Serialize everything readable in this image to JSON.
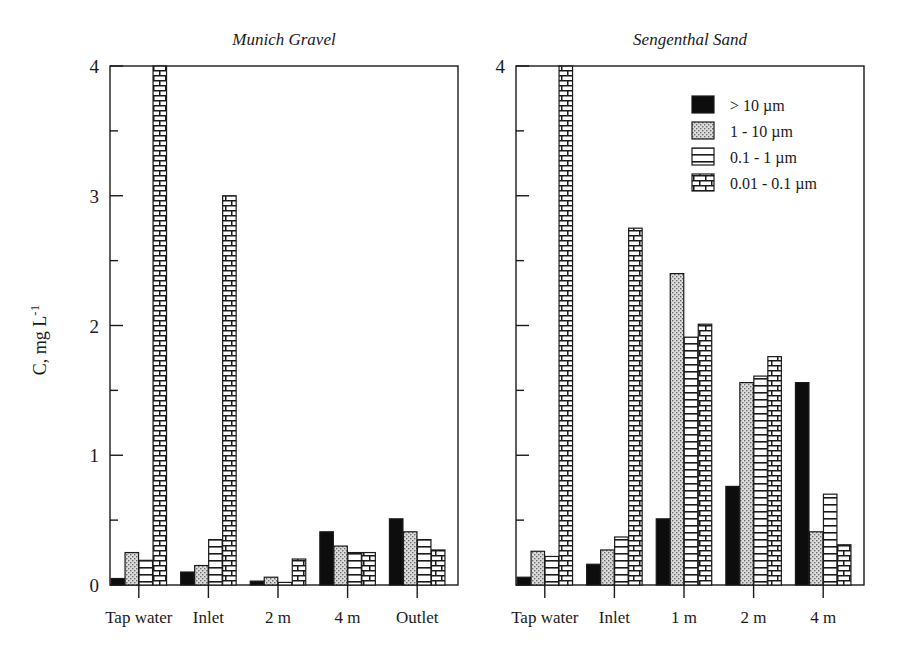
{
  "figure": {
    "axis_y_label": "C, mg L",
    "axis_y_label_sup": "-1",
    "y_ticks": [
      "0",
      "1",
      "2",
      "3",
      "4"
    ],
    "y_min": 0,
    "y_max": 4
  },
  "legend": {
    "position": "top-right-of-right-panel",
    "items": [
      {
        "label": "> 10 µm",
        "pattern": "solid-black",
        "color": "#0d0d0d"
      },
      {
        "label": "1 - 10 µm",
        "pattern": "stipple-dots",
        "color": "#cccccc"
      },
      {
        "label": "0.1 - 1 µm",
        "pattern": "horizontal-lines",
        "color": "#ffffff"
      },
      {
        "label": "0.01 - 0.1 µm",
        "pattern": "brick",
        "color": "#ffffff"
      }
    ]
  },
  "panels": [
    {
      "id": "munich-gravel",
      "title": "Munich Gravel"
    },
    {
      "id": "sengenthal-sand",
      "title": "Sengenthal Sand"
    }
  ],
  "chart_data": [
    {
      "type": "bar",
      "title": "Munich Gravel",
      "xlabel": "",
      "ylabel": "C, mg L-1",
      "ylim": [
        0,
        4
      ],
      "grid": false,
      "legend": [
        "> 10 µm",
        "1 - 10 µm",
        "0.1 - 1 µm",
        "0.01 - 0.1 µm"
      ],
      "categories": [
        "Tap water",
        "Inlet",
        "2 m",
        "4 m",
        "Outlet"
      ],
      "series": [
        {
          "name": "> 10 µm",
          "values": [
            0.05,
            0.1,
            0.03,
            0.41,
            0.51
          ]
        },
        {
          "name": "1 - 10 µm",
          "values": [
            0.25,
            0.15,
            0.06,
            0.3,
            0.41
          ]
        },
        {
          "name": "0.1 - 1 µm",
          "values": [
            0.19,
            0.35,
            0.02,
            0.25,
            0.35
          ]
        },
        {
          "name": "0.01 - 0.1 µm",
          "values": [
            4.0,
            3.0,
            0.2,
            0.25,
            0.27
          ]
        }
      ],
      "notes": "Tap water 0.01-0.1 um bar is clipped at the axis maximum of 4"
    },
    {
      "type": "bar",
      "title": "Sengenthal Sand",
      "xlabel": "",
      "ylabel": "C, mg L-1",
      "ylim": [
        0,
        4
      ],
      "grid": false,
      "legend": [
        "> 10 µm",
        "1 - 10 µm",
        "0.1 - 1 µm",
        "0.01 - 0.1 µm"
      ],
      "categories": [
        "Tap water",
        "Inlet",
        "1 m",
        "2 m",
        "4 m"
      ],
      "series": [
        {
          "name": "> 10 µm",
          "values": [
            0.06,
            0.16,
            0.51,
            0.76,
            1.56
          ]
        },
        {
          "name": "1 - 10 µm",
          "values": [
            0.26,
            0.27,
            2.4,
            1.56,
            0.41
          ]
        },
        {
          "name": "0.1 - 1 µm",
          "values": [
            0.22,
            0.37,
            1.91,
            1.61,
            0.7
          ]
        },
        {
          "name": "0.01 - 0.1 µm",
          "values": [
            4.0,
            2.75,
            2.01,
            1.76,
            0.31
          ]
        }
      ],
      "notes": "Tap water 0.01-0.1 um bar is clipped at the axis maximum of 4"
    }
  ]
}
